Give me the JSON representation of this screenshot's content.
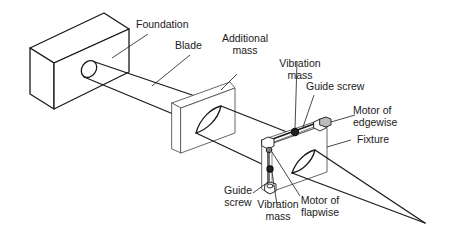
{
  "diagram": {
    "type": "schematic",
    "colors": {
      "line": "#1a1a1a",
      "thin_line": "#555555",
      "mass": "#222222",
      "background": "#ffffff"
    },
    "labels": {
      "foundation": "Foundation",
      "blade": "Blade",
      "additional_mass_l1": "Additional",
      "additional_mass_l2": "mass",
      "vibration_mass_top_l1": "Vibration",
      "vibration_mass_top_l2": "mass",
      "guide_screw_top": "Guide screw",
      "motor_edgewise_l1": "Motor of",
      "motor_edgewise_l2": "edgewise",
      "fixture": "Fixture",
      "guide_screw_bottom_l1": "Guide",
      "guide_screw_bottom_l2": "screw",
      "vibration_mass_bottom_l1": "Vibration",
      "vibration_mass_bottom_l2": "mass",
      "motor_flapwise_l1": "Motor of",
      "motor_flapwise_l2": "flapwise"
    },
    "components": [
      "Foundation",
      "Blade",
      "Additional mass",
      "Fixture",
      "Guide screw (edgewise)",
      "Vibration mass (edgewise)",
      "Motor of edgewise",
      "Guide screw (flapwise)",
      "Vibration mass (flapwise)",
      "Motor of flapwise"
    ]
  }
}
